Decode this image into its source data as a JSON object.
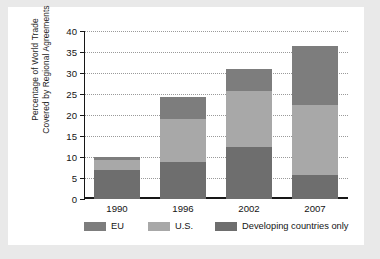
{
  "chart_data": {
    "type": "bar",
    "stacked": true,
    "title": "",
    "xlabel": "",
    "ylabel": "Percentage of World Trade\nCovered by Regional Agreements",
    "categories": [
      "1990",
      "1996",
      "2002",
      "2007"
    ],
    "ylim": [
      0,
      40
    ],
    "yticks": [
      0,
      5,
      10,
      15,
      20,
      25,
      30,
      35,
      40
    ],
    "ytick_labels": [
      "0",
      "5",
      "10",
      "15",
      "20",
      "25",
      "30",
      "35",
      "40"
    ],
    "grid": true,
    "grid_style": "dotted-horizontal",
    "legend_position": "bottom",
    "stack_order_bottom_to_top": [
      "Developing countries only",
      "U.S.",
      "EU"
    ],
    "series": [
      {
        "name": "Developing countries only",
        "color": "#6e6e6e",
        "values": [
          7.0,
          8.7,
          12.3,
          5.8
        ]
      },
      {
        "name": "U.S.",
        "color": "#a8a8a8",
        "values": [
          2.3,
          10.3,
          13.5,
          16.7
        ]
      },
      {
        "name": "EU",
        "color": "#7d7d7d",
        "values": [
          0.7,
          5.3,
          5.2,
          14.0
        ]
      }
    ],
    "totals": [
      10.0,
      24.3,
      31.0,
      36.5
    ],
    "segment_tops": {
      "1990": [
        7.0,
        9.3,
        10.0
      ],
      "1996": [
        8.7,
        19.0,
        24.3
      ],
      "2002": [
        12.3,
        25.8,
        31.0
      ],
      "2007": [
        5.8,
        22.5,
        36.5
      ]
    }
  },
  "legend": {
    "items": [
      {
        "label": "EU",
        "color": "#7d7d7d"
      },
      {
        "label": "U.S.",
        "color": "#a8a8a8"
      },
      {
        "label": "Developing countries only",
        "color": "#6e6e6e"
      }
    ]
  },
  "colors": {
    "page_background": "#e9e9e9",
    "figure_background": "#ffffff",
    "axis": "#171717",
    "grid": "#9a9a9a",
    "text": "#141414"
  }
}
